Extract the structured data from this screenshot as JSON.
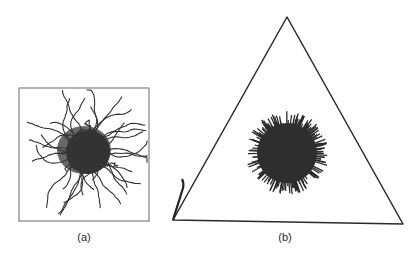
{
  "figure": {
    "panels": [
      {
        "id": "a",
        "label": "(a)",
        "frame": "square",
        "content": "polymer chain cluster with wiggly tendrils (random-coil chains)",
        "frame_box": {
          "x": 19,
          "y": 88,
          "w": 130,
          "h": 133
        },
        "core_center": {
          "x": 88,
          "y": 152
        },
        "core_radius": 22
      },
      {
        "id": "b",
        "label": "(b)",
        "frame": "triangle",
        "content": "dense spherical brush-like cluster with straight radial bristles",
        "triangle_vertices": [
          [
            287,
            17
          ],
          [
            173,
            220
          ],
          [
            403,
            224
          ]
        ],
        "core_center": {
          "x": 287,
          "y": 153
        },
        "core_radius": 38
      }
    ],
    "colors": {
      "ink": "#2b2b2b",
      "frame": "#555555",
      "background": "#ffffff"
    }
  }
}
